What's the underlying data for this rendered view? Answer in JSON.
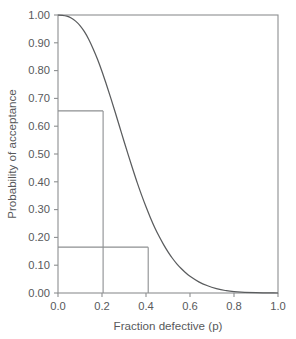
{
  "chart_data": {
    "type": "line",
    "title": "",
    "xlabel": "Fraction defective (p)",
    "ylabel": "Probability of acceptance",
    "xlim": [
      0.0,
      1.0
    ],
    "ylim": [
      0.0,
      1.0
    ],
    "grid": false,
    "legend": false,
    "x_ticks": [
      0.0,
      0.2,
      0.4,
      0.6,
      0.8,
      1.0
    ],
    "x_tick_labels": [
      "0.0",
      "0.2",
      "0.4",
      "0.6",
      "0.8",
      "1.0"
    ],
    "y_ticks": [
      0.0,
      0.1,
      0.2,
      0.3,
      0.4,
      0.5,
      0.6,
      0.7,
      0.8,
      0.9,
      1.0
    ],
    "y_tick_labels": [
      "0.00",
      "0.10",
      "0.20",
      "0.30",
      "0.40",
      "0.50",
      "0.60",
      "0.70",
      "0.80",
      "0.90",
      "1.00"
    ],
    "series": [
      {
        "name": "Operating characteristic curve",
        "x": [
          0.0,
          0.02,
          0.04,
          0.06,
          0.08,
          0.1,
          0.12,
          0.14,
          0.16,
          0.18,
          0.2,
          0.22,
          0.24,
          0.26,
          0.28,
          0.3,
          0.32,
          0.34,
          0.36,
          0.38,
          0.4,
          0.42,
          0.44,
          0.46,
          0.48,
          0.5,
          0.52,
          0.54,
          0.56,
          0.58,
          0.6,
          0.64,
          0.68,
          0.72,
          0.76,
          0.8,
          0.9,
          1.0
        ],
        "y": [
          1.0,
          0.999,
          0.996,
          0.989,
          0.978,
          0.962,
          0.94,
          0.912,
          0.878,
          0.84,
          0.797,
          0.75,
          0.701,
          0.65,
          0.598,
          0.546,
          0.495,
          0.445,
          0.397,
          0.352,
          0.31,
          0.271,
          0.235,
          0.203,
          0.174,
          0.148,
          0.125,
          0.105,
          0.088,
          0.073,
          0.06,
          0.04,
          0.026,
          0.016,
          0.009,
          0.005,
          0.001,
          0.0
        ]
      }
    ],
    "annotations": [
      {
        "name": "producer-risk-reference",
        "p": 0.205,
        "pa": 0.655,
        "type": "corner-lines"
      },
      {
        "name": "consumer-risk-reference",
        "p": 0.41,
        "pa": 0.165,
        "type": "corner-lines"
      }
    ]
  }
}
